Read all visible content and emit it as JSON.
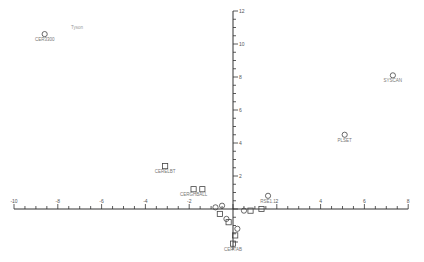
{
  "chart_data": {
    "type": "scatter",
    "title": "",
    "xlabel": "",
    "ylabel": "",
    "xlim": [
      -10,
      8
    ],
    "ylim": [
      -2,
      12
    ],
    "grid": false,
    "x_ticks": [
      -10,
      -8,
      -6,
      -4,
      -2,
      2,
      4,
      6,
      8
    ],
    "y_ticks": [
      2,
      4,
      6,
      8,
      10,
      12
    ],
    "annotations": [
      {
        "text": "Tyson",
        "x": -7.4,
        "y": 10.9
      }
    ],
    "series": [
      {
        "name": "circles",
        "marker": "circle",
        "points": [
          {
            "label": "CER3300",
            "x": -8.6,
            "y": 10.6
          },
          {
            "label": "SYSCAN",
            "x": 7.3,
            "y": 8.1
          },
          {
            "label": "PLSET",
            "x": 5.1,
            "y": 4.5
          },
          {
            "label": "RSE1.1",
            "x": 1.6,
            "y": 0.8
          },
          {
            "label": "",
            "x": -0.8,
            "y": 0.1
          },
          {
            "label": "",
            "x": -0.5,
            "y": 0.2
          },
          {
            "label": "",
            "x": 0.5,
            "y": -0.1
          },
          {
            "label": "",
            "x": -0.3,
            "y": -0.6
          },
          {
            "label": "",
            "x": 0.2,
            "y": -1.2
          }
        ]
      },
      {
        "name": "squares",
        "marker": "square",
        "points": [
          {
            "label": "CERELBT",
            "x": -3.1,
            "y": 2.6
          },
          {
            "label": "CERGHBALL",
            "x": -1.8,
            "y": 1.2
          },
          {
            "label": "",
            "x": -1.4,
            "y": 1.2
          },
          {
            "label": "",
            "x": 1.3,
            "y": 0.0
          },
          {
            "label": "",
            "x": 0.8,
            "y": -0.1
          },
          {
            "label": "",
            "x": -0.6,
            "y": -0.3
          },
          {
            "label": "",
            "x": -0.2,
            "y": -0.8
          },
          {
            "label": "",
            "x": 0.1,
            "y": -1.6
          },
          {
            "label": "CERTAB",
            "x": 0.0,
            "y": -2.1
          }
        ]
      }
    ]
  }
}
